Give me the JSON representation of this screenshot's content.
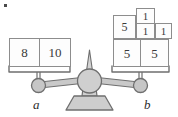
{
  "figure": {
    "type": "balance-scale-diagram",
    "corner_mark": "",
    "colors": {
      "block_stroke": "#8d8d8d",
      "block_fill": "#fdfdfd",
      "text": "#3a3a3a",
      "metal_fill": "#cfcfcf",
      "metal_stroke": "#6f6f6f",
      "background": "#ffffff"
    },
    "balance_state": "level"
  },
  "left_pan": {
    "label": "a",
    "blocks": [
      {
        "value": "8"
      },
      {
        "value": "10"
      }
    ]
  },
  "right_pan": {
    "label": "b",
    "top_row": [
      {
        "value": "1"
      }
    ],
    "middle_row": [
      {
        "value": "5"
      },
      {
        "value": "1"
      },
      {
        "value": "1"
      }
    ],
    "bottom_row": [
      {
        "value": "5"
      },
      {
        "value": "5"
      }
    ]
  }
}
